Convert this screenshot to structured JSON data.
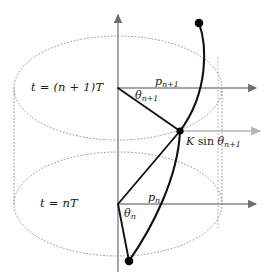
{
  "figure": {
    "type": "kicked-rotor-cylinder-diagram",
    "width": 274,
    "height": 278,
    "background": "#ffffff",
    "colors": {
      "trajectory": "#111111",
      "axis": "#808080",
      "kick_arrow": "#aaaaaa",
      "dotted_cylinder": "#8c8c8c",
      "text": "#1a1a1a",
      "marker": "#000000"
    }
  },
  "labels": {
    "time_upper": {
      "lhs": "t",
      "eq": "=",
      "rhs": "(n + 1)T"
    },
    "time_lower": {
      "lhs": "t",
      "eq": "=",
      "rhs": "nT"
    },
    "momentum_upper": {
      "symbol": "p",
      "subscript": "n+1"
    },
    "momentum_lower": {
      "symbol": "p",
      "subscript": "n"
    },
    "angle_upper": {
      "symbol": "θ",
      "subscript": "n+1"
    },
    "angle_lower": {
      "symbol": "θ",
      "subscript": "n"
    },
    "kick": {
      "coefficient": "K",
      "function": "sin",
      "symbol": "θ",
      "subscript": "n+1"
    }
  },
  "geometry": {
    "vertical_axis": {
      "x": 118,
      "y_top": 14,
      "y_bottom": 272
    },
    "upper_plane_axis": {
      "x1": 118,
      "y": 88,
      "x2": 258
    },
    "lower_plane_axis": {
      "x1": 118,
      "y": 204,
      "x2": 258
    },
    "kick_arrow": {
      "x1": 180,
      "y": 131,
      "x2": 262
    },
    "upper_ellipse": {
      "cx": 118,
      "cy": 88,
      "rx": 104,
      "ry": 52
    },
    "lower_ellipse": {
      "cx": 118,
      "cy": 204,
      "rx": 104,
      "ry": 52
    },
    "cylinder_left_edge": {
      "x": 14,
      "y1": 88,
      "y2": 204
    },
    "cylinder_right_edge": {
      "x": 222,
      "y1": 88,
      "y2": 204
    },
    "guide_vertical_dotted": {
      "x": 218,
      "y1": 60,
      "y2": 226
    },
    "markers": [
      {
        "name": "start-point-upper",
        "x": 199,
        "y": 23
      },
      {
        "name": "kick-point",
        "x": 180,
        "y": 131
      },
      {
        "name": "start-point-lower",
        "x": 129,
        "y": 261
      }
    ],
    "momentum_vector_upper": {
      "x1": 118,
      "y1": 88,
      "x2": 180,
      "y2": 131
    },
    "momentum_vector_lower": {
      "x1": 118,
      "y1": 204,
      "x2": 180,
      "y2": 131
    },
    "angle_arc_upper": {
      "cx": 118,
      "cy": 88,
      "r": 34
    },
    "angle_arc_lower": {
      "cx": 118,
      "cy": 204,
      "r": 26
    }
  }
}
